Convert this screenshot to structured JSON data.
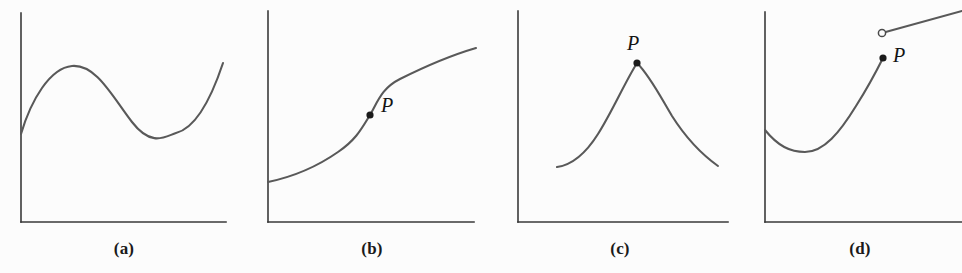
{
  "figure": {
    "width": 962,
    "height": 273,
    "background_color": "#fcfcfc",
    "curve_color": "#595959",
    "axis_color": "#3a3a3a",
    "point_color": "#1b1b1b"
  },
  "panels": [
    {
      "id": "a",
      "caption": "(a)",
      "caption_x": 124,
      "caption_y": 239,
      "description": "smooth differentiable curve with local maximum and local minimum",
      "axes": {
        "x_axis": "M 21 222 L 226 222",
        "y_axis": "M 21 222 L 21 13"
      },
      "curve": "M 21 134 C 31 100 50 68 72 66 C 96 64 112 96 132 122 C 152 148 166 136 176 133 C 196 128 212 96 223 63",
      "points": []
    },
    {
      "id": "b",
      "caption": "(b)",
      "caption_x": 372,
      "caption_y": 239,
      "description": "increasing curve with vertical tangent line at P",
      "axes": {
        "x_axis": "M 268 222 L 474 222",
        "y_axis": "M 268 222 L 268 11"
      },
      "curve": "M 268 182 C 292 177 318 166 338 152 C 356 140 362 128 370 115 C 378 101 382 88 400 79 C 420 69 452 55 476 48",
      "points": [
        {
          "kind": "filled",
          "cx": 370,
          "cy": 115,
          "r": 3.6,
          "label": "P",
          "label_x": 381,
          "label_y": 112
        }
      ]
    },
    {
      "id": "c",
      "caption": "(c)",
      "caption_x": 620,
      "caption_y": 239,
      "description": "curve with a sharp corner (no tangent line) at P",
      "axes": {
        "x_axis": "M 518 222 L 728 222",
        "y_axis": "M 518 222 L 518 11"
      },
      "curve": "M 557 167 C 572 165 586 153 598 134 C 612 112 624 84 637 63 C 650 76 660 96 672 116 C 686 138 704 156 718 166",
      "points": [
        {
          "kind": "filled",
          "cx": 637,
          "cy": 63,
          "r": 3.6,
          "label": "P",
          "label_x": 627,
          "label_y": 50
        }
      ]
    },
    {
      "id": "d",
      "caption": "(d)",
      "caption_x": 860,
      "caption_y": 239,
      "description": "curve with a jump discontinuity at P: filled endpoint below, open endpoint above",
      "axes": {
        "x_axis": "M 765 222 L 962 222",
        "y_axis": "M 765 222 L 765 12"
      },
      "curve": "M 765 130 C 778 146 790 152 805 152 C 824 152 840 132 856 106 C 870 84 878 68 883 58",
      "curve_second": "M 882 33 L 962 11",
      "points": [
        {
          "kind": "filled",
          "cx": 883,
          "cy": 58,
          "r": 3.6,
          "label": "P",
          "label_x": 893,
          "label_y": 62
        },
        {
          "kind": "open",
          "cx": 882,
          "cy": 33,
          "r": 3.6,
          "label": "",
          "label_x": 0,
          "label_y": 0
        }
      ]
    }
  ],
  "chart_data": {
    "type": "line",
    "title": "",
    "xlabel": "",
    "ylabel": "",
    "grid": false,
    "legend": "none",
    "subplots": [
      {
        "label": "(a)",
        "concept": "differentiable everywhere - smooth curve",
        "feature": "none",
        "has_marked_point": false,
        "shape": "rises from y-axis to local maximum, falls to local minimum, rises again"
      },
      {
        "label": "(b)",
        "concept": "vertical tangent at P",
        "feature": "vertical-tangent",
        "has_marked_point": true,
        "point_label": "P",
        "shape": "S-shaped increasing curve steepening to vertical at P then flattening"
      },
      {
        "label": "(c)",
        "concept": "corner at P - no tangent line",
        "feature": "corner",
        "has_marked_point": true,
        "point_label": "P",
        "shape": "concave-up rise to a sharp peak at P, then concave-down descent"
      },
      {
        "label": "(d)",
        "concept": "jump discontinuity at P",
        "feature": "discontinuity",
        "has_marked_point": true,
        "point_label": "P",
        "shape": "U-shaped curve rising to filled endpoint P, then open endpoint above with straight line rising right"
      }
    ]
  }
}
